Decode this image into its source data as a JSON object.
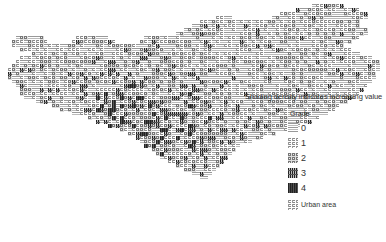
{
  "legend": {
    "title": "Shading density indicates increasing value",
    "grade_label": "Grade",
    "grades": [
      {
        "label": "0",
        "swatch": "grade-0-pattern"
      },
      {
        "label": "1",
        "swatch": "grade-1-pattern"
      },
      {
        "label": "2",
        "swatch": "grade-2-pattern"
      },
      {
        "label": "3",
        "swatch": "grade-3-pattern"
      },
      {
        "label": "4",
        "swatch": "grade-4-pattern"
      }
    ],
    "urban_label": "Urban area"
  },
  "map": {
    "cell_size": 4,
    "colors": {
      "grade0": "#cfcfcf",
      "grade1": "#a8a8a8",
      "grade2": "#7f7f7f",
      "grade3": "#3f3f3f",
      "grade4": "#151515"
    },
    "rows": [
      [
        4,
        108,
        116
      ],
      [
        5,
        100,
        132
      ],
      [
        6,
        96,
        140
      ],
      [
        7,
        92,
        146
      ],
      [
        8,
        88,
        150
      ],
      [
        9,
        8,
        22,
        38,
        54,
        72,
        160
      ],
      [
        10,
        6,
        24,
        36,
        58,
        70,
        166
      ],
      [
        11,
        6,
        168
      ],
      [
        12,
        10,
        176
      ],
      [
        13,
        16,
        180
      ],
      [
        14,
        10,
        186
      ],
      [
        15,
        8,
        190
      ],
      [
        16,
        6,
        190
      ],
      [
        17,
        4,
        190
      ],
      [
        18,
        4,
        188
      ],
      [
        19,
        4,
        188
      ],
      [
        20,
        6,
        186
      ],
      [
        21,
        8,
        184
      ],
      [
        22,
        10,
        182
      ],
      [
        23,
        10,
        180
      ],
      [
        24,
        12,
        178
      ],
      [
        25,
        18,
        174
      ],
      [
        26,
        26,
        170
      ],
      [
        27,
        30,
        168
      ],
      [
        28,
        36,
        164
      ],
      [
        29,
        44,
        160
      ],
      [
        30,
        48,
        156
      ],
      [
        31,
        54,
        150
      ],
      [
        32,
        60,
        144
      ],
      [
        33,
        64,
        138
      ],
      [
        34,
        68,
        132
      ],
      [
        35,
        70,
        126
      ],
      [
        36,
        72,
        120
      ],
      [
        37,
        76,
        118
      ],
      [
        38,
        78,
        116
      ],
      [
        39,
        80,
        114
      ],
      [
        40,
        84,
        112
      ],
      [
        41,
        88,
        110
      ],
      [
        42,
        92,
        108
      ],
      [
        43,
        96,
        106
      ],
      [
        44,
        100,
        104
      ]
    ],
    "ne_lobe": [
      [
        1,
        78,
        86
      ],
      [
        2,
        74,
        90
      ],
      [
        3,
        70,
        92
      ],
      [
        4,
        68,
        92
      ],
      [
        5,
        66,
        90
      ],
      [
        6,
        64,
        90
      ],
      [
        7,
        66,
        92
      ],
      [
        8,
        68,
        92
      ],
      [
        9,
        68,
        90
      ],
      [
        10,
        66,
        88
      ],
      [
        11,
        64,
        86
      ],
      [
        12,
        64,
        84
      ],
      [
        13,
        62,
        82
      ],
      [
        14,
        62,
        80
      ],
      [
        15,
        60,
        76
      ],
      [
        16,
        58,
        72
      ],
      [
        17,
        58,
        70
      ],
      [
        18,
        58,
        68
      ],
      [
        19,
        58,
        66
      ],
      [
        20,
        58,
        64
      ]
    ]
  }
}
